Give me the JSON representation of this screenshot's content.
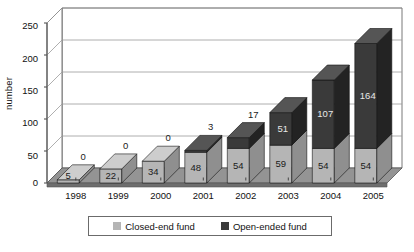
{
  "chart_data": {
    "type": "bar",
    "subtype": "stacked-column-3d",
    "title": "",
    "xlabel": "",
    "ylabel": "number",
    "ylim": [
      0,
      250
    ],
    "yticks": [
      0,
      50,
      100,
      150,
      200,
      250
    ],
    "grid": true,
    "legend_position": "bottom",
    "categories": [
      "1998",
      "1999",
      "2000",
      "2001",
      "2002",
      "2003",
      "2004",
      "2005"
    ],
    "series": [
      {
        "name": "Closed-end fund",
        "color": "#b5b5b5",
        "values": [
          5,
          22,
          34,
          48,
          54,
          59,
          54,
          54
        ]
      },
      {
        "name": "Open-ended fund",
        "color": "#3a3a3a",
        "values": [
          0,
          0,
          0,
          3,
          17,
          51,
          107,
          164
        ]
      }
    ],
    "totals": [
      5,
      22,
      34,
      51,
      71,
      110,
      161,
      218
    ],
    "data_labels": {
      "closed_end": [
        "5",
        "22",
        "34",
        "48",
        "54",
        "59",
        "54",
        "54"
      ],
      "open_ended": [
        "0",
        "0",
        "0",
        "3",
        "17",
        "51",
        "107",
        "164"
      ]
    }
  },
  "axis": {
    "y_label": "number",
    "y_ticks": [
      "250",
      "200",
      "150",
      "100",
      "50",
      "0"
    ],
    "x_ticks": [
      "1998",
      "1999",
      "2000",
      "2001",
      "2002",
      "2003",
      "2004",
      "2005"
    ]
  },
  "legend": {
    "items": [
      {
        "label": "Closed-end fund",
        "color": "#b5b5b5"
      },
      {
        "label": "Open-ended fund",
        "color": "#3a3a3a"
      }
    ]
  },
  "colors": {
    "closed_end": "#b5b5b5",
    "closed_end_side": "#8f8f8f",
    "closed_end_top": "#cdcdcd",
    "open_ended": "#3a3a3a",
    "open_ended_side": "#232323",
    "open_ended_top": "#555555",
    "floor": "#949494",
    "floor_side": "#6e6e6e",
    "axis_line": "#555555",
    "grid_line": "#9a9a9a",
    "legend_border": "#6b6b6b",
    "background": "#ffffff"
  }
}
